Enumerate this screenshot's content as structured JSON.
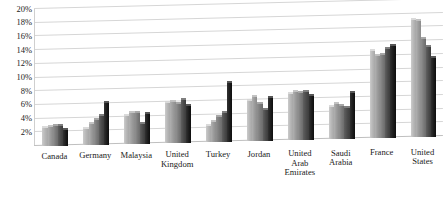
{
  "chart_data": {
    "type": "bar",
    "title": "",
    "subtitle": "",
    "xlabel": "",
    "ylabel": "",
    "ylim": [
      0,
      20
    ],
    "ytick_labels": [
      "2%",
      "4%",
      "6%",
      "8%",
      "10%",
      "12%",
      "14%",
      "16%",
      "18%",
      "20%"
    ],
    "ytick_values": [
      2,
      4,
      6,
      8,
      10,
      12,
      14,
      16,
      18,
      20
    ],
    "grid": true,
    "legend": "none",
    "style": "3d-clustered-column",
    "categories": [
      "Canada",
      "Germany",
      "Malaysia",
      "United\nKingdom",
      "Turkey",
      "Jordan",
      "United\nArab\nEmirates",
      "Saudi\nArabia",
      "France",
      "United\nStates"
    ],
    "series": [
      {
        "name": "Series 1",
        "color": "#b5b5b5",
        "values": [
          2.6,
          2.3,
          4.0,
          5.7,
          2.2,
          5.7,
          6.6,
          4.6,
          12.6,
          17.0
        ]
      },
      {
        "name": "Series 2",
        "color": "#9a9a9a",
        "values": [
          2.7,
          3.0,
          4.4,
          5.9,
          2.9,
          6.3,
          7.0,
          5.0,
          11.9,
          16.8
        ]
      },
      {
        "name": "Series 3",
        "color": "#7a7a7a",
        "values": [
          2.8,
          3.6,
          4.5,
          5.6,
          3.6,
          5.4,
          6.8,
          4.8,
          12.0,
          14.2
        ]
      },
      {
        "name": "Series 4",
        "color": "#4a4a4a",
        "values": [
          2.8,
          4.1,
          2.9,
          6.2,
          4.2,
          4.4,
          6.9,
          4.4,
          12.9,
          13.0
        ]
      },
      {
        "name": "Series 5",
        "color": "#1c1c1c",
        "values": [
          2.3,
          6.1,
          4.3,
          5.4,
          8.6,
          6.2,
          6.4,
          6.6,
          13.3,
          11.5
        ]
      }
    ]
  }
}
